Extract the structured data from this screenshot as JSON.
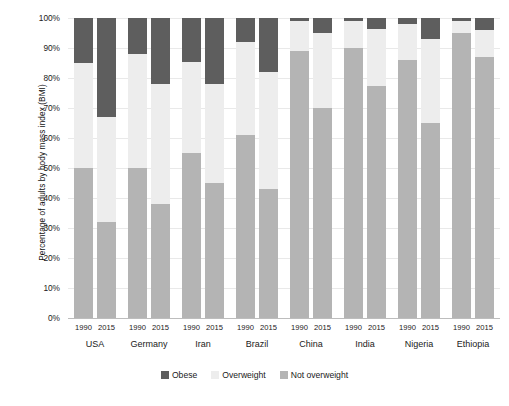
{
  "chart_data": {
    "type": "bar",
    "stacked": true,
    "title": "",
    "xlabel": "",
    "ylabel": "Percentage of adults by body mass index (BMI)",
    "ylim": [
      0,
      100
    ],
    "ytick_labels": [
      "100%",
      "90%",
      "80%",
      "70%",
      "60%",
      "50%",
      "40%",
      "30%",
      "20%",
      "10%",
      "0%"
    ],
    "ytick_values": [
      100,
      90,
      80,
      70,
      60,
      50,
      40,
      30,
      20,
      10,
      0
    ],
    "grid": true,
    "legend_position": "bottom",
    "categories": [
      "USA 1990",
      "USA 2015",
      "Germany 1990",
      "Germany 2015",
      "Iran 1990",
      "Iran 2015",
      "Brazil 1990",
      "Brazil 2015",
      "China 1990",
      "China 2015",
      "India 1990",
      "India 2015",
      "Nigeria 1990",
      "Nigeria 2015",
      "Ethiopia 1990",
      "Ethiopia 2015"
    ],
    "countries": [
      "USA",
      "Germany",
      "Iran",
      "Brazil",
      "China",
      "India",
      "Nigeria",
      "Ethiopia"
    ],
    "years": [
      "1990",
      "2015"
    ],
    "series": [
      {
        "name": "Obese",
        "color": "#5e5e5e",
        "values": [
          15,
          33,
          12,
          22,
          14.5,
          22,
          8,
          18,
          1,
          5,
          1,
          3.5,
          2,
          7,
          1,
          4
        ]
      },
      {
        "name": "Overweight",
        "color": "#ededed",
        "values": [
          35,
          35,
          38,
          40,
          30.5,
          33,
          31,
          39,
          10,
          25,
          9,
          19,
          12,
          28,
          4,
          9
        ]
      },
      {
        "name": "Not overweight",
        "color": "#b4b4b4",
        "values": [
          50,
          32,
          50,
          38,
          55,
          45,
          61,
          43,
          89,
          70,
          90,
          77.5,
          86,
          65,
          95,
          87
        ]
      }
    ]
  },
  "legend": {
    "items": [
      {
        "label": "Obese",
        "color": "#5e5e5e",
        "swatch": "legend-swatch-obese"
      },
      {
        "label": "Overweight",
        "color": "#ededed",
        "swatch": "legend-swatch-overweight"
      },
      {
        "label": "Not overweight",
        "color": "#b4b4b4",
        "swatch": "legend-swatch-not-overweight"
      }
    ]
  },
  "axis": {
    "y_title": "Percentage of adults by body mass index (BMI)"
  },
  "colors": {
    "obese": "#5e5e5e",
    "overweight": "#ededed",
    "not_overweight": "#b4b4b4",
    "gridline": "#e9e9e9",
    "baseline": "#bdbdbd",
    "background": "#ffffff",
    "text": "#1a1a1a"
  }
}
